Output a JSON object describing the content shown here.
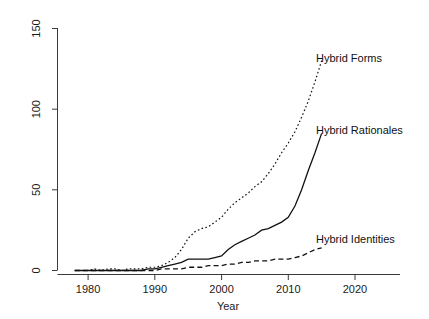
{
  "chart_data": {
    "type": "line",
    "title": "",
    "subtitle": "",
    "xlabel": "Year",
    "ylabel": "",
    "xlim": [
      1978,
      2026
    ],
    "ylim": [
      0,
      150
    ],
    "xticks": [
      1980,
      1990,
      2000,
      2010,
      2020
    ],
    "yticks": [
      0,
      50,
      100,
      150
    ],
    "grid": false,
    "legend_position": "inline-right-annotations",
    "x": [
      1978,
      1979,
      1980,
      1981,
      1982,
      1983,
      1984,
      1985,
      1986,
      1987,
      1988,
      1989,
      1990,
      1991,
      1992,
      1993,
      1994,
      1995,
      1996,
      1997,
      1998,
      1999,
      2000,
      2001,
      2002,
      2003,
      2004,
      2005,
      2006,
      2007,
      2008,
      2009,
      2010,
      2011,
      2012,
      2013,
      2014,
      2015
    ],
    "series": [
      {
        "name": "Hybrid Forms",
        "style": "dotted",
        "values": [
          0,
          0,
          0,
          1,
          0,
          1,
          1,
          0,
          1,
          1,
          1,
          2,
          2,
          3,
          5,
          8,
          13,
          20,
          24,
          26,
          27,
          30,
          33,
          38,
          42,
          45,
          48,
          52,
          55,
          60,
          66,
          73,
          79,
          86,
          95,
          105,
          117,
          130
        ]
      },
      {
        "name": "Hybrid Rationales",
        "style": "solid",
        "values": [
          0,
          0,
          0,
          0,
          0,
          0,
          0,
          0,
          0,
          0,
          0,
          1,
          1,
          2,
          3,
          4,
          5,
          7,
          7,
          7,
          7,
          8,
          9,
          13,
          16,
          18,
          20,
          22,
          25,
          26,
          28,
          30,
          33,
          40,
          50,
          62,
          73,
          85
        ]
      },
      {
        "name": "Hybrid Identities",
        "style": "dashed",
        "values": [
          0,
          0,
          0,
          0,
          0,
          0,
          0,
          0,
          0,
          0,
          0,
          0,
          0,
          1,
          1,
          1,
          1,
          2,
          2,
          2,
          3,
          3,
          3,
          4,
          4,
          5,
          5,
          6,
          6,
          6,
          7,
          7,
          7,
          8,
          9,
          11,
          13,
          14
        ]
      }
    ],
    "annotations": [
      {
        "text": "Hybrid Forms",
        "x": 2016,
        "y": 128
      },
      {
        "text": "Hybrid Rationales",
        "x": 2016,
        "y": 86
      },
      {
        "text": "Hybrid Identities",
        "x": 2016,
        "y": 24
      }
    ]
  },
  "axes": {
    "x_tick_labels": [
      "1980",
      "1990",
      "2000",
      "2010",
      "2020"
    ],
    "y_tick_labels": [
      "0",
      "50",
      "100",
      "150"
    ],
    "x_axis_title": "Year"
  },
  "labels": {
    "hybrid_forms": "Hybrid Forms",
    "hybrid_rationales": "Hybrid Rationales",
    "hybrid_identities": "Hybrid Identities"
  },
  "colors": {
    "background": "#ffffff",
    "axis": "#3a3a3a",
    "ink": "#111111"
  }
}
